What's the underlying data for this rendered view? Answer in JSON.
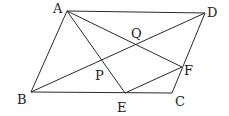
{
  "figure": {
    "type": "geometry",
    "shape": "parallelogram ABCD",
    "points": {
      "A": {
        "x": 67,
        "y": 11
      },
      "B": {
        "x": 31,
        "y": 92
      },
      "C": {
        "x": 172,
        "y": 93
      },
      "D": {
        "x": 205,
        "y": 13
      },
      "E": {
        "x": 125,
        "y": 93
      },
      "F": {
        "x": 182,
        "y": 67
      },
      "P": {
        "x": 101,
        "y": 61
      },
      "Q": {
        "x": 137,
        "y": 43
      }
    },
    "labels": {
      "A": "A",
      "B": "B",
      "C": "C",
      "D": "D",
      "E": "E",
      "F": "F",
      "P": "P",
      "Q": "Q"
    },
    "segments": [
      [
        "A",
        "B"
      ],
      [
        "B",
        "C"
      ],
      [
        "C",
        "D"
      ],
      [
        "D",
        "A"
      ],
      [
        "B",
        "D"
      ],
      [
        "A",
        "E"
      ],
      [
        "A",
        "F"
      ],
      [
        "E",
        "F"
      ]
    ],
    "colors": {
      "line": "#2a2a2a",
      "background": "#ffffff"
    }
  }
}
